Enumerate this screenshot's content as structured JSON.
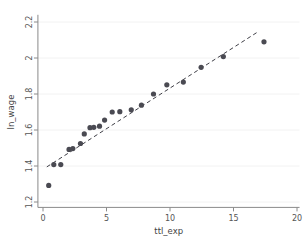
{
  "chart_data": {
    "type": "scatter",
    "title": "",
    "xlabel": "ttl_exp",
    "ylabel": "ln_wage",
    "xlim": [
      -0.4,
      20.2
    ],
    "ylim": [
      1.17,
      2.23
    ],
    "xticks": [
      0,
      5,
      10,
      15,
      20
    ],
    "yticks": [
      1.2,
      1.4,
      1.6,
      1.8,
      2,
      2.2
    ],
    "xtick_labels": [
      "0",
      "5",
      "10",
      "15",
      "20"
    ],
    "ytick_labels": [
      "1.2",
      "1.4",
      "1.6",
      "1.8",
      "2",
      "2.2"
    ],
    "grid": false,
    "legend": "none",
    "marker_color": "#4a4a52",
    "line_color": "#3f3f47",
    "axis_color": "#8a8a8a",
    "background": "#ffffff",
    "points": [
      {
        "x": 0.45,
        "y": 1.292
      },
      {
        "x": 0.85,
        "y": 1.408
      },
      {
        "x": 1.4,
        "y": 1.408
      },
      {
        "x": 2.05,
        "y": 1.492
      },
      {
        "x": 2.35,
        "y": 1.497
      },
      {
        "x": 2.95,
        "y": 1.525
      },
      {
        "x": 3.25,
        "y": 1.578
      },
      {
        "x": 3.7,
        "y": 1.613
      },
      {
        "x": 4.0,
        "y": 1.615
      },
      {
        "x": 4.45,
        "y": 1.621
      },
      {
        "x": 4.85,
        "y": 1.655
      },
      {
        "x": 5.45,
        "y": 1.7
      },
      {
        "x": 6.05,
        "y": 1.702
      },
      {
        "x": 6.95,
        "y": 1.712
      },
      {
        "x": 7.75,
        "y": 1.738
      },
      {
        "x": 8.7,
        "y": 1.8
      },
      {
        "x": 9.75,
        "y": 1.851
      },
      {
        "x": 11.05,
        "y": 1.866
      },
      {
        "x": 12.45,
        "y": 1.948
      },
      {
        "x": 14.2,
        "y": 2.008
      },
      {
        "x": 17.4,
        "y": 2.09
      }
    ],
    "fit_line": {
      "style": "dashed",
      "x_start": 0.3,
      "y_start": 1.395,
      "x_end": 16.85,
      "y_end": 2.142
    }
  }
}
